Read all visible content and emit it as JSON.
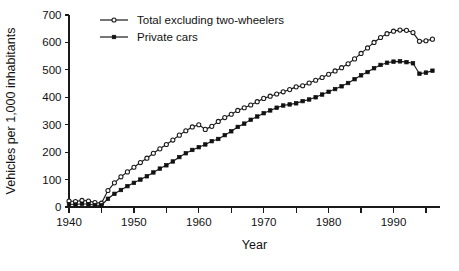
{
  "chart_data": {
    "type": "line",
    "title": "",
    "subtitle": "",
    "xlabel": "Year",
    "ylabel": "Vehicles per 1,000 inhabitants",
    "xlim": [
      1940,
      1997
    ],
    "ylim": [
      0,
      700
    ],
    "ytick_values": [
      0,
      100,
      200,
      300,
      400,
      500,
      600,
      700
    ],
    "ytick_labels": [
      "0",
      "100",
      "200",
      "300",
      "400",
      "500",
      "600",
      "700"
    ],
    "xtick_values": [
      1940,
      1950,
      1960,
      1970,
      1980,
      1990
    ],
    "xtick_labels": [
      "1940",
      "1950",
      "1960",
      "1970",
      "1980",
      "1990"
    ],
    "xtick_minor_values": [
      1945,
      1955,
      1965,
      1975,
      1985,
      1995
    ],
    "grid": false,
    "legend_position": "top-left-inside",
    "annotations": [],
    "x": [
      1940,
      1941,
      1942,
      1943,
      1944,
      1945,
      1946,
      1947,
      1948,
      1949,
      1950,
      1951,
      1952,
      1953,
      1954,
      1955,
      1956,
      1957,
      1958,
      1959,
      1960,
      1961,
      1962,
      1963,
      1964,
      1965,
      1966,
      1967,
      1968,
      1969,
      1970,
      1971,
      1972,
      1973,
      1974,
      1975,
      1976,
      1977,
      1978,
      1979,
      1980,
      1981,
      1982,
      1983,
      1984,
      1985,
      1986,
      1987,
      1988,
      1989,
      1990,
      1991,
      1992,
      1993,
      1994,
      1995,
      1996
    ],
    "series": [
      {
        "name": "Total excluding two-wheelers",
        "marker": "open-circle",
        "values": [
          22,
          20,
          24,
          22,
          16,
          14,
          60,
          88,
          110,
          128,
          145,
          162,
          178,
          196,
          212,
          228,
          244,
          262,
          278,
          292,
          300,
          283,
          294,
          312,
          326,
          338,
          352,
          362,
          372,
          384,
          396,
          404,
          412,
          420,
          428,
          438,
          442,
          452,
          462,
          472,
          484,
          496,
          508,
          522,
          540,
          560,
          580,
          600,
          618,
          632,
          641,
          645,
          644,
          636,
          604,
          606,
          612
        ]
      },
      {
        "name": "Private cars",
        "marker": "filled-square",
        "values": [
          10,
          9,
          12,
          10,
          7,
          6,
          30,
          48,
          62,
          76,
          88,
          100,
          112,
          126,
          140,
          152,
          166,
          182,
          196,
          208,
          218,
          228,
          240,
          248,
          262,
          276,
          292,
          304,
          318,
          330,
          342,
          352,
          362,
          370,
          374,
          378,
          386,
          392,
          400,
          410,
          420,
          430,
          440,
          452,
          466,
          480,
          492,
          506,
          518,
          526,
          530,
          531,
          528,
          524,
          486,
          490,
          497
        ]
      }
    ]
  },
  "legend": {
    "entries": [
      {
        "label": "Total excluding two-wheelers",
        "marker": "open-circle"
      },
      {
        "label": "Private cars",
        "marker": "filled-square"
      }
    ]
  }
}
